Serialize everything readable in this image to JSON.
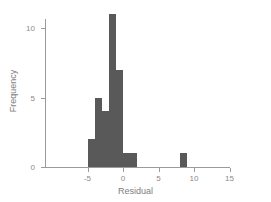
{
  "chart_data": {
    "type": "bar",
    "subtype": "histogram",
    "title": "",
    "xlabel": "Residual",
    "ylabel": "Frequency",
    "xlim": [
      -7.5,
      16
    ],
    "ylim": [
      0,
      11.6
    ],
    "xticks": [
      -5,
      0,
      5,
      10,
      15
    ],
    "xtick_labels": [
      "-5",
      "0",
      "5",
      "10",
      "15"
    ],
    "yticks": [
      0,
      5,
      10
    ],
    "ytick_labels": [
      "0",
      "5",
      "10"
    ],
    "grid": false,
    "legend": false,
    "bin_width": 1,
    "bar_color": "#595959",
    "axis_color": "#9b9b9b",
    "text_color": "#8a8a8a",
    "background": "#ffffff",
    "bins": [
      {
        "bin_start": -5,
        "bin_end": -4,
        "x_center": -4.5,
        "frequency": 2
      },
      {
        "bin_start": -4,
        "bin_end": -3,
        "x_center": -3.5,
        "frequency": 5
      },
      {
        "bin_start": -3,
        "bin_end": -2,
        "x_center": -2.5,
        "frequency": 4
      },
      {
        "bin_start": -2,
        "bin_end": -1,
        "x_center": -1.5,
        "frequency": 11
      },
      {
        "bin_start": -1,
        "bin_end": 0,
        "x_center": -0.5,
        "frequency": 7
      },
      {
        "bin_start": 0,
        "bin_end": 1,
        "x_center": 0.5,
        "frequency": 1
      },
      {
        "bin_start": 1,
        "bin_end": 2,
        "x_center": 1.5,
        "frequency": 1
      },
      {
        "bin_start": 8,
        "bin_end": 9,
        "x_center": 8.5,
        "frequency": 1
      }
    ],
    "categories": [
      "-5",
      "-4",
      "-3",
      "-2",
      "-1",
      "0",
      "1",
      "8"
    ],
    "values": [
      2,
      5,
      4,
      11,
      7,
      1,
      1,
      1
    ]
  },
  "axes": {
    "x_title": "Residual",
    "y_title": "Frequency",
    "x_ticks": [
      {
        "label": "-5",
        "value": -5
      },
      {
        "label": "0",
        "value": 0
      },
      {
        "label": "5",
        "value": 5
      },
      {
        "label": "10",
        "value": 10
      },
      {
        "label": "15",
        "value": 15
      }
    ],
    "y_ticks": [
      {
        "label": "0",
        "value": 0
      },
      {
        "label": "5",
        "value": 5
      },
      {
        "label": "10",
        "value": 10
      }
    ]
  },
  "geometry": {
    "x_origin_px": 123,
    "x_unit_px": 7.1,
    "y_origin_px": 167,
    "y_unit_px": 13.9,
    "bar_width_px": 7.1
  }
}
